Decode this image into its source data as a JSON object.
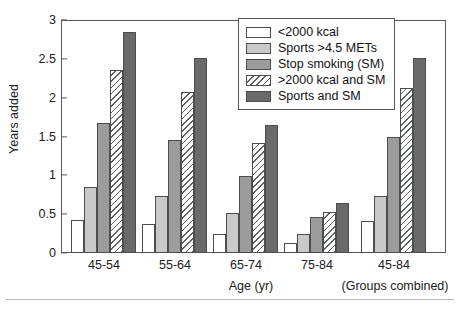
{
  "chart_data": {
    "type": "bar",
    "title": "",
    "xlabel": "Age (yr)",
    "ylabel": "Years added",
    "ylim": [
      0,
      3
    ],
    "yticks": [
      "0",
      "0.5",
      "1",
      "1.5",
      "2",
      "2.5",
      "3"
    ],
    "ytick_values": [
      0,
      0.5,
      1,
      1.5,
      2,
      2.5,
      3
    ],
    "grid": false,
    "legend_position": "top-right",
    "categories": [
      "45-54",
      "55-64",
      "65-74",
      "75-84",
      "45-84"
    ],
    "annotations": [
      "(Groups combined)"
    ],
    "series": [
      {
        "name": "<2000 kcal",
        "fill": "white",
        "values": [
          0.43,
          0.37,
          0.25,
          0.13,
          0.41
        ]
      },
      {
        "name": "Sports >4.5 METs",
        "fill": "light-gray",
        "values": [
          0.85,
          0.73,
          0.51,
          0.25,
          0.74
        ]
      },
      {
        "name": "Stop smoking (SM)",
        "fill": "mid-gray",
        "values": [
          1.67,
          1.45,
          0.99,
          0.46,
          1.5
        ]
      },
      {
        "name": ">2000 kcal and SM",
        "fill": "hatched",
        "values": [
          2.35,
          2.07,
          1.41,
          0.53,
          2.12
        ]
      },
      {
        "name": "Sports and SM",
        "fill": "dark-gray",
        "values": [
          2.85,
          2.51,
          1.65,
          0.64,
          2.51
        ]
      }
    ]
  },
  "axes": {
    "y_title": "Years added",
    "x_title": "Age (yr)",
    "x_note": "(Groups combined)"
  },
  "legend": {
    "items": [
      {
        "label": "<2000 kcal"
      },
      {
        "label": "Sports >4.5 METs"
      },
      {
        "label": "Stop smoking (SM)"
      },
      {
        "label": ">2000 kcal and SM"
      },
      {
        "label": "Sports and SM"
      }
    ]
  },
  "colors": {
    "series_white": "#ffffff",
    "series_light_gray": "#c9c9c9",
    "series_mid_gray": "#9c9c9c",
    "series_hatch_line": "#5e6265",
    "series_dark_gray": "#6a6a6a",
    "axis": "#55595c",
    "text": "#202020"
  }
}
